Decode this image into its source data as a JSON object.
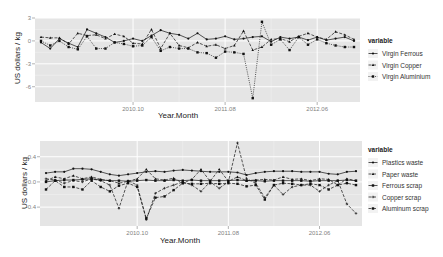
{
  "chart_data": [
    {
      "type": "line",
      "title": "",
      "xlabel": "Year.Month",
      "ylabel": "US dollars / kg",
      "x_tick_labels": [
        "2010.10",
        "2011.08",
        "2012.06"
      ],
      "x_tick_index": [
        10,
        20,
        30
      ],
      "y_tick_labels": [
        "3",
        "0",
        "-3",
        "-6"
      ],
      "y_tick_values": [
        3,
        0,
        -3,
        -6
      ],
      "ylim": [
        -8,
        3
      ],
      "n_points": 35,
      "grid": true,
      "legend_title": "variable",
      "legend_position": "right",
      "series": [
        {
          "name": "Virgin Ferrous",
          "linestyle": "solid",
          "values": [
            -0.2,
            -1.0,
            0.3,
            -0.3,
            -0.8,
            1.5,
            1.0,
            0.5,
            -0.2,
            0.0,
            0.3,
            0.0,
            0.7,
            1.4,
            1.0,
            0.8,
            0.3,
            1.0,
            0.2,
            0.3,
            0.6,
            0.2,
            0.3,
            0.5,
            0.6,
            -0.1,
            0.5,
            0.3,
            0.5,
            0.1,
            0.5,
            0.1,
            0.3,
            0.5,
            0.0
          ]
        },
        {
          "name": "Virgin Copper",
          "linestyle": "dashed",
          "values": [
            0.5,
            0.4,
            0.4,
            -0.4,
            1.0,
            0.7,
            0.8,
            0.3,
            0.9,
            0.6,
            -0.3,
            -0.4,
            1.5,
            -1.0,
            1.0,
            -0.6,
            -0.9,
            -0.2,
            -0.7,
            -0.5,
            -1.0,
            -0.6,
            1.3,
            -1.2,
            -0.8,
            0.2,
            0.3,
            -0.1,
            0.6,
            1.0,
            0.5,
            0.2,
            1.2,
            0.8,
            0.2
          ]
        },
        {
          "name": "Virgin Aluminium",
          "linestyle": "dotted",
          "values": [
            0.0,
            -0.6,
            0.0,
            -0.8,
            -1.1,
            0.6,
            -1.0,
            -1.0,
            -0.2,
            -0.4,
            -0.7,
            -0.6,
            0.5,
            -1.3,
            -0.8,
            -1.0,
            -1.0,
            -1.5,
            -1.6,
            -2.2,
            -1.4,
            -1.5,
            -1.7,
            -7.5,
            2.5,
            -0.5,
            0.2,
            -1.2,
            0.5,
            -0.5,
            0.2,
            -0.3,
            -0.6,
            -0.8,
            -0.8
          ]
        }
      ]
    },
    {
      "type": "line",
      "title": "",
      "xlabel": "Year.Month",
      "ylabel": "US dollars / kg",
      "x_tick_labels": [
        "2010.10",
        "2011.08",
        "2012.06"
      ],
      "x_tick_index": [
        10,
        20,
        30
      ],
      "y_tick_labels": [
        "0.4",
        "0.0",
        "-0.4"
      ],
      "y_tick_values": [
        0.4,
        0.0,
        -0.4
      ],
      "ylim": [
        -0.7,
        0.65
      ],
      "n_points": 35,
      "grid": true,
      "legend_title": "variable",
      "legend_position": "right",
      "series": [
        {
          "name": "Plastics waste",
          "linestyle": "solid",
          "values": [
            0.14,
            0.16,
            0.16,
            0.21,
            0.21,
            0.2,
            0.16,
            0.12,
            0.1,
            0.12,
            0.14,
            0.16,
            0.17,
            0.16,
            0.18,
            0.19,
            0.18,
            0.17,
            0.16,
            0.16,
            0.16,
            0.15,
            0.11,
            0.14,
            0.16,
            0.17,
            0.17,
            0.17,
            0.16,
            0.16,
            0.16,
            0.13,
            0.12,
            0.16,
            0.17
          ]
        },
        {
          "name": "Paper waste",
          "linestyle": "dashed",
          "values": [
            0.02,
            0.08,
            0.05,
            0.1,
            0.05,
            0.08,
            0.04,
            0.02,
            -0.02,
            0.01,
            0.05,
            0.2,
            0.05,
            0.03,
            0.06,
            -0.02,
            0.04,
            0.2,
            0.01,
            0.2,
            0.01,
            0.08,
            0.02,
            0.03,
            0.04,
            0.03,
            0.08,
            0.04,
            0.05,
            0.02,
            0.05,
            0.04,
            -0.05,
            0.05,
            0.02
          ]
        },
        {
          "name": "Ferrous scrap",
          "linestyle": "solid",
          "values": [
            0.0,
            0.02,
            0.03,
            0.03,
            0.04,
            0.05,
            0.03,
            0.02,
            0.02,
            0.01,
            0.02,
            0.03,
            0.02,
            0.02,
            0.03,
            0.02,
            0.03,
            0.02,
            0.02,
            0.02,
            0.02,
            0.03,
            0.02,
            0.02,
            0.01,
            0.02,
            0.02,
            0.02,
            0.02,
            0.01,
            0.02,
            0.02,
            0.02,
            0.03,
            0.02
          ]
        },
        {
          "name": "Copper scrap",
          "linestyle": "dashed",
          "values": [
            0.05,
            0.03,
            -0.02,
            0.02,
            0.0,
            0.05,
            0.02,
            -0.05,
            -0.42,
            0.02,
            -0.05,
            -0.6,
            -0.18,
            -0.1,
            -0.05,
            0.0,
            -0.05,
            -0.15,
            0.0,
            -0.1,
            0.0,
            0.62,
            0.05,
            -0.02,
            -0.25,
            -0.05,
            -0.2,
            -0.08,
            -0.05,
            -0.05,
            -0.15,
            -0.05,
            0.02,
            -0.35,
            -0.5
          ]
        },
        {
          "name": "Aluminum scrap",
          "linestyle": "dashed",
          "values": [
            -0.12,
            0.02,
            -0.08,
            -0.08,
            -0.12,
            0.02,
            -0.08,
            -0.15,
            -0.06,
            -0.02,
            -0.08,
            -0.58,
            -0.25,
            -0.23,
            -0.13,
            -0.02,
            -0.03,
            -0.03,
            -0.02,
            -0.03,
            -0.02,
            -0.03,
            -0.07,
            -0.05,
            -0.28,
            -0.05,
            -0.02,
            -0.03,
            -0.05,
            -0.03,
            -0.05,
            -0.12,
            -0.05,
            -0.02,
            -0.05
          ]
        }
      ]
    }
  ]
}
